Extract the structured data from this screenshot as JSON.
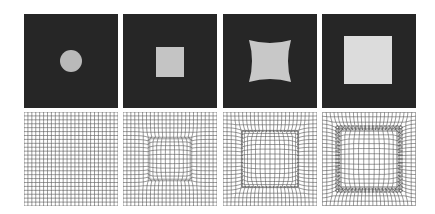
{
  "figure": {
    "background": "#ffffff",
    "columns": [
      {
        "index": 0,
        "shape": "circle",
        "deformation": 0.0
      },
      {
        "index": 1,
        "shape": "small-square",
        "deformation": 0.55
      },
      {
        "index": 2,
        "shape": "concave-square",
        "deformation": 0.8
      },
      {
        "index": 3,
        "shape": "large-square",
        "deformation": 1.0
      }
    ],
    "colors": {
      "image_bg": "#262626",
      "shape_fill": "#bdbdbd",
      "shape_fill_bright": "#dcdcdc",
      "grid_line": "#555555"
    },
    "grid_cells": 24
  }
}
